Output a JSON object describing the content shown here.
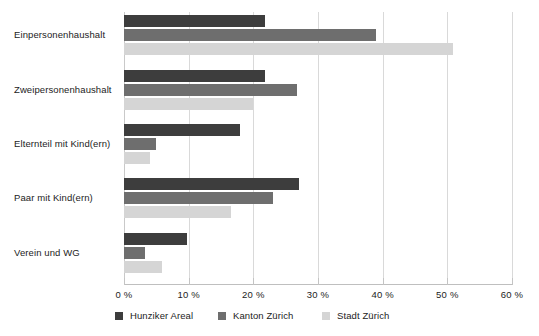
{
  "chart_data": {
    "type": "bar",
    "orientation": "horizontal",
    "title": "",
    "subtitle": "",
    "xlabel": "",
    "ylabel": "",
    "xlim": [
      0,
      60
    ],
    "xticks": [
      0,
      10,
      20,
      30,
      40,
      50,
      60
    ],
    "xtick_labels": [
      "0 %",
      "10 %",
      "20 %",
      "30 %",
      "40 %",
      "50 %",
      "60 %"
    ],
    "grid": true,
    "grid_axis": "x",
    "legend_position": "bottom",
    "categories": [
      "Einpersonenhaushalt",
      "Zweipersonenhaushalt",
      "Elternteil mit Kind(ern)",
      "Paar mit Kind(ern)",
      "Verein und WG"
    ],
    "series": [
      {
        "name": "Hunziker Areal",
        "color": "#3d3d3d",
        "values": [
          21.8,
          21.8,
          18.0,
          27.0,
          9.8
        ]
      },
      {
        "name": "Kanton Zürich",
        "color": "#6e6e6e",
        "values": [
          38.9,
          26.8,
          5.0,
          23.0,
          3.3
        ]
      },
      {
        "name": "Stadt Zürich",
        "color": "#d5d5d5",
        "values": [
          50.8,
          20.0,
          4.0,
          16.5,
          5.8
        ]
      }
    ]
  },
  "legend": {
    "items": [
      {
        "label": "Hunziker Areal",
        "color": "#3d3d3d"
      },
      {
        "label": "Kanton Zürich",
        "color": "#6e6e6e"
      },
      {
        "label": "Stadt Zürich",
        "color": "#d5d5d5"
      }
    ]
  },
  "axis": {
    "tick_labels": [
      "0 %",
      "10 %",
      "20 %",
      "30 %",
      "40 %",
      "50 %",
      "60 %"
    ]
  },
  "colors": {
    "series_dark": "#3d3d3d",
    "series_medium": "#6e6e6e",
    "series_light": "#d5d5d5",
    "gridline": "#d9d9d9",
    "axis_line": "#bfbfbf",
    "text": "#1c1c1c",
    "background": "#ffffff"
  }
}
